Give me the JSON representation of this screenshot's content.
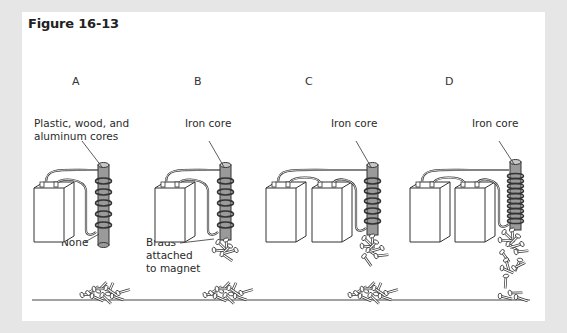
{
  "figure": {
    "title": "Figure 16-13"
  },
  "columns": [
    {
      "letter": "A",
      "core_label_line1": "Plastic, wood, and",
      "core_label_line2": "aluminum cores",
      "result_label": "None",
      "batteries": 1,
      "coil_turns": 5
    },
    {
      "letter": "B",
      "core_label": "Iron core",
      "result_label_line1": "Brads",
      "result_label_line2": "attached",
      "result_label_line3": "to magnet",
      "batteries": 1,
      "coil_turns": 5
    },
    {
      "letter": "C",
      "core_label": "Iron core",
      "batteries": 2,
      "coil_turns": 5
    },
    {
      "letter": "D",
      "core_label": "Iron core",
      "batteries": 2,
      "coil_turns": 10
    }
  ],
  "colors": {
    "background": "#e6e6e6",
    "panel": "#ffffff",
    "core_fill": "#9a9a9a",
    "line": "#333333"
  }
}
